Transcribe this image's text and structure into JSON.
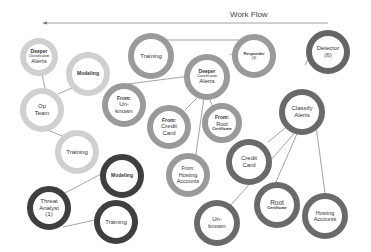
{
  "header": {
    "title": "Work Flow",
    "arrow_direction": "left"
  },
  "colors": {
    "light_ring": "#d0d0d0",
    "mid_ring": "#9a9a9a",
    "dark_ring": "#555555",
    "line": "#666666"
  },
  "nodes": {
    "deeper_left": {
      "line1": "Deeper",
      "line2": "Classification",
      "line3": "Alerts"
    },
    "modeling_left": {
      "label": "Modeling"
    },
    "op_team": {
      "line1": "Op",
      "line2": "Team"
    },
    "training_left": {
      "label": "Training"
    },
    "training_top": {
      "label": "Training"
    },
    "deeper_center": {
      "line1": "Deeper",
      "line2": "Classification",
      "line3": "Alerts"
    },
    "responder": {
      "line1": "Responder",
      "line2": "(4)"
    },
    "from_unknown": {
      "line1": "From:",
      "line2": "Un-",
      "line3": "known"
    },
    "from_credit": {
      "line1": "From:",
      "line2": "Credit",
      "line3": "Card"
    },
    "from_root": {
      "line1": "From:",
      "line2": "Root",
      "line3": "Certificate"
    },
    "from_hosting": {
      "line1": "From:",
      "line2": "Hosting",
      "line3": "Accounts"
    },
    "detector": {
      "line1": "Detector",
      "line2": "(6)"
    },
    "classify": {
      "line1": "Classify",
      "line2": "Alerts"
    },
    "credit_card": {
      "line1": "Credit",
      "line2": "Card"
    },
    "unknown": {
      "line1": "Un-",
      "line2": "known"
    },
    "root_cert": {
      "line1": "Root",
      "line2": "Certificate"
    },
    "hosting": {
      "line1": "Hosting",
      "line2": "Accounts"
    },
    "threat_analyst": {
      "line1": "Threat",
      "line2": "Analyst",
      "line3": "(1)"
    },
    "modeling_bottom": {
      "label": "Modeling"
    },
    "training_bottom": {
      "label": "Training"
    }
  }
}
